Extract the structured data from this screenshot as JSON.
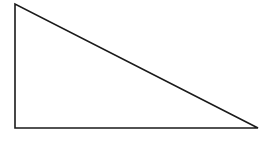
{
  "diagram": {
    "shape": "right-triangle",
    "stroke_color": "#1a1a1a",
    "fill_color": "#ffffff",
    "stroke_width": 1.6,
    "vertices": {
      "top": {
        "x": 15,
        "y": 4
      },
      "right_angle": {
        "x": 15,
        "y": 128
      },
      "bottom_right": {
        "x": 258,
        "y": 128
      }
    }
  }
}
